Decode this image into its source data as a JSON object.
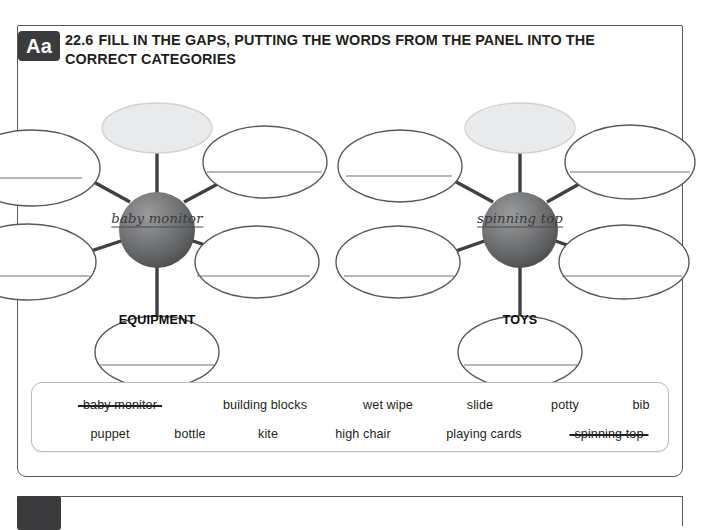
{
  "exercise": {
    "badge": "Aa",
    "number": "22.6",
    "title": "FILL IN THE GAPS, PUTTING THE WORDS FROM THE PANEL INTO THE CORRECT CATEGORIES"
  },
  "mindmaps": [
    {
      "id": "equipment",
      "center_label": "EQUIPMENT",
      "filled_answer": "baby monitor",
      "branch_count": 6,
      "filled_branch_index": 0
    },
    {
      "id": "toys",
      "center_label": "TOYS",
      "filled_answer": "spinning top",
      "branch_count": 6,
      "filled_branch_index": 0
    }
  ],
  "word_bank": {
    "rows": [
      [
        {
          "text": "baby monitor",
          "used": true,
          "x": 88
        },
        {
          "text": "building blocks",
          "used": false,
          "x": 233
        },
        {
          "text": "wet wipe",
          "used": false,
          "x": 356
        },
        {
          "text": "slide",
          "used": false,
          "x": 448
        },
        {
          "text": "potty",
          "used": false,
          "x": 533
        },
        {
          "text": "bib",
          "used": false,
          "x": 609
        }
      ],
      [
        {
          "text": "puppet",
          "used": false,
          "x": 78
        },
        {
          "text": "bottle",
          "used": false,
          "x": 158
        },
        {
          "text": "kite",
          "used": false,
          "x": 236
        },
        {
          "text": "high chair",
          "used": false,
          "x": 331
        },
        {
          "text": "playing cards",
          "used": false,
          "x": 452
        },
        {
          "text": "spinning top",
          "used": true,
          "x": 577
        }
      ]
    ]
  },
  "colors": {
    "badge_bg": "#3b3b3d",
    "panel_border": "#58595b",
    "sphere_light": "#8d8e90",
    "sphere_dark": "#4a4b4d",
    "bubble_stroke": "#58595b",
    "filled_bubble_fill": "#e9eaeb",
    "answer_line": "#6f7072",
    "text": "#231f20"
  }
}
